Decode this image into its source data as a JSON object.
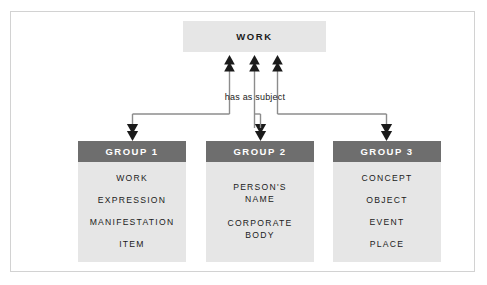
{
  "diagram": {
    "type": "hierarchy-flow-diagram",
    "title_node": {
      "label": "WORK",
      "fill": "#e6e6e6"
    },
    "relation": {
      "label": "has as subject"
    },
    "colors": {
      "header_fill": "#6e6e6e",
      "header_text": "#ffffff",
      "body_fill": "#e6e6e6",
      "body_text": "#1b1b1b",
      "frame_border": "#d2d2d2",
      "connector": "#8c8c8c",
      "arrowhead": "#1b1b1b",
      "page_background": "#ffffff"
    },
    "groups": [
      {
        "header": "GROUP 1",
        "items": [
          "WORK",
          "EXPRESSION",
          "MANIFESTATION",
          "ITEM"
        ]
      },
      {
        "header": "GROUP 2",
        "items": [
          "PERSON'S\nNAME",
          "CORPORATE\nBODY"
        ]
      },
      {
        "header": "GROUP 3",
        "items": [
          "CONCEPT",
          "OBJECT",
          "EVENT",
          "PLACE"
        ]
      }
    ]
  }
}
